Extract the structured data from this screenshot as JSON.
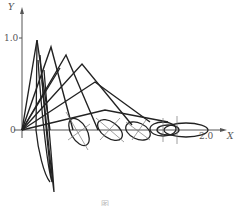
{
  "figure": {
    "axes": {
      "y_label": "Y",
      "x_label": "X",
      "y_tick": "1.0",
      "x_tick": "2.0",
      "origin_label": "0"
    },
    "caption": "图 … …",
    "colors": {
      "line": "#222222",
      "axis": "#555555",
      "background": "#ffffff"
    }
  }
}
